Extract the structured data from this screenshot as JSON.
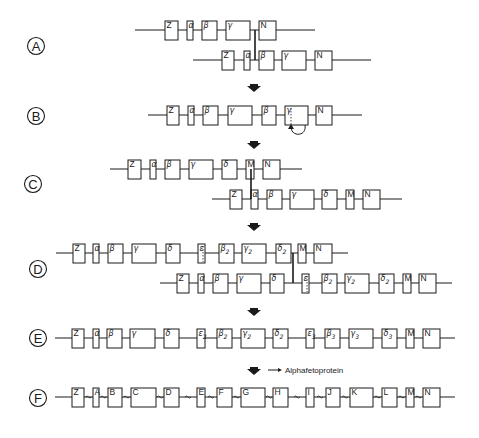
{
  "figure": {
    "note_label": "Alphafetoprotein",
    "colors": {
      "ink": "#1a1a1a",
      "background": "#ffffff"
    }
  },
  "steps": [
    {
      "id": "A",
      "label": "A",
      "strands": [
        {
          "y": 30,
          "x1": 135,
          "x2": 315,
          "exons": [
            {
              "label": "Z",
              "x": 165,
              "w": 13
            },
            {
              "label": "α",
              "x": 187,
              "w": 6
            },
            {
              "label": "β",
              "x": 202,
              "w": 15
            },
            {
              "label": "γ",
              "x": 226,
              "w": 24
            },
            {
              "label": "N",
              "x": 259,
              "w": 17
            }
          ]
        },
        {
          "y": 60,
          "x1": 193,
          "x2": 371,
          "exons": [
            {
              "label": "Z",
              "x": 222,
              "w": 12
            },
            {
              "label": "α",
              "x": 244,
              "w": 6
            },
            {
              "label": "β",
              "x": 259,
              "w": 15
            },
            {
              "label": "γ",
              "x": 282,
              "w": 24
            },
            {
              "label": "N",
              "x": 315,
              "w": 17
            }
          ]
        }
      ],
      "crossover": {
        "x": 255,
        "y1": 30,
        "y2": 60
      }
    },
    {
      "id": "B",
      "label": "B",
      "strands": [
        {
          "y": 115,
          "x1": 148,
          "x2": 362,
          "exons": [
            {
              "label": "Z",
              "x": 167,
              "w": 12
            },
            {
              "label": "α",
              "x": 188,
              "w": 6
            },
            {
              "label": "β",
              "x": 203,
              "w": 15
            },
            {
              "label": "γ",
              "x": 228,
              "w": 24
            },
            {
              "label": "β",
              "x": 262,
              "w": 14
            },
            {
              "label": "γ",
              "x": 285,
              "w": 23
            },
            {
              "label": "N",
              "x": 316,
              "w": 16
            }
          ]
        }
      ],
      "annotation": "curved arrow under second γ"
    },
    {
      "id": "C",
      "label": "C",
      "strands": [
        {
          "y": 169,
          "x1": 110,
          "x2": 302,
          "exons": [
            {
              "label": "Z",
              "x": 128,
              "w": 13
            },
            {
              "label": "α",
              "x": 150,
              "w": 6
            },
            {
              "label": "β",
              "x": 165,
              "w": 15
            },
            {
              "label": "γ",
              "x": 189,
              "w": 24
            },
            {
              "label": "δ",
              "x": 222,
              "w": 15
            },
            {
              "label": "M",
              "x": 246,
              "w": 8
            },
            {
              "label": "N",
              "x": 263,
              "w": 17
            }
          ]
        },
        {
          "y": 199,
          "x1": 212,
          "x2": 402,
          "exons": [
            {
              "label": "Z",
              "x": 230,
              "w": 12
            },
            {
              "label": "α",
              "x": 251,
              "w": 7
            },
            {
              "label": "β",
              "x": 267,
              "w": 15
            },
            {
              "label": "γ",
              "x": 290,
              "w": 24
            },
            {
              "label": "δ",
              "x": 322,
              "w": 15
            },
            {
              "label": "M",
              "x": 346,
              "w": 8
            },
            {
              "label": "N",
              "x": 363,
              "w": 17
            }
          ]
        }
      ],
      "crossover": {
        "x": 251,
        "y1": 169,
        "y2": 199
      }
    },
    {
      "id": "D",
      "label": "D",
      "strands": [
        {
          "y": 253,
          "x1": 56,
          "x2": 348,
          "exons": [
            {
              "label": "Z",
              "x": 73,
              "w": 12
            },
            {
              "label": "α",
              "x": 93,
              "w": 6
            },
            {
              "label": "β",
              "x": 108,
              "w": 15
            },
            {
              "label": "γ",
              "x": 132,
              "w": 24
            },
            {
              "label": "δ",
              "x": 166,
              "w": 14
            },
            {
              "label": "ε",
              "x": 198,
              "w": 7,
              "dotted": true
            },
            {
              "label": "β",
              "sub": "2",
              "x": 219,
              "w": 15
            },
            {
              "label": "γ",
              "sub": "2",
              "x": 242,
              "w": 24
            },
            {
              "label": "δ",
              "sub": "2",
              "x": 276,
              "w": 15
            },
            {
              "label": "M",
              "x": 298,
              "w": 8
            },
            {
              "label": "N",
              "x": 314,
              "w": 18
            }
          ]
        },
        {
          "y": 283,
          "x1": 160,
          "x2": 452,
          "exons": [
            {
              "label": "Z",
              "x": 177,
              "w": 12
            },
            {
              "label": "α",
              "x": 198,
              "w": 6
            },
            {
              "label": "β",
              "x": 213,
              "w": 15
            },
            {
              "label": "γ",
              "x": 237,
              "w": 24
            },
            {
              "label": "δ",
              "x": 270,
              "w": 14
            },
            {
              "label": "ε",
              "x": 302,
              "w": 7,
              "dotted": true
            },
            {
              "label": "β",
              "sub": "2",
              "x": 322,
              "w": 15
            },
            {
              "label": "γ",
              "sub": "2",
              "x": 345,
              "w": 24
            },
            {
              "label": "δ",
              "sub": "2",
              "x": 379,
              "w": 15
            },
            {
              "label": "M",
              "x": 403,
              "w": 8
            },
            {
              "label": "N",
              "x": 419,
              "w": 17
            }
          ]
        }
      ],
      "crossover": {
        "x": 293,
        "y1": 253,
        "y2": 283
      }
    },
    {
      "id": "E",
      "label": "E",
      "strands": [
        {
          "y": 338,
          "x1": 55,
          "x2": 455,
          "exons": [
            {
              "label": "Z",
              "x": 72,
              "w": 12
            },
            {
              "label": "α",
              "x": 93,
              "w": 6
            },
            {
              "label": "β",
              "x": 107,
              "w": 15
            },
            {
              "label": "γ",
              "x": 130,
              "w": 25
            },
            {
              "label": "δ",
              "x": 164,
              "w": 15
            },
            {
              "label": "ε",
              "sub": "2",
              "x": 197,
              "w": 8
            },
            {
              "label": "β",
              "sub": "2",
              "x": 217,
              "w": 15
            },
            {
              "label": "γ",
              "sub": "2",
              "x": 241,
              "w": 24
            },
            {
              "label": "δ",
              "sub": "2",
              "x": 273,
              "w": 15
            },
            {
              "label": "ε",
              "sub": "3",
              "x": 306,
              "w": 8
            },
            {
              "label": "β",
              "sub": "3",
              "x": 325,
              "w": 15
            },
            {
              "label": "γ",
              "sub": "3",
              "x": 349,
              "w": 24
            },
            {
              "label": "δ",
              "sub": "3",
              "x": 382,
              "w": 15
            },
            {
              "label": "M",
              "x": 406,
              "w": 8
            },
            {
              "label": "N",
              "x": 423,
              "w": 17
            }
          ]
        }
      ]
    },
    {
      "id": "F",
      "label": "F",
      "strands": [
        {
          "y": 397,
          "x1": 55,
          "x2": 455,
          "introns_wavy": true,
          "exons": [
            {
              "label": "Z",
              "x": 72,
              "w": 12
            },
            {
              "label": "A",
              "x": 93,
              "w": 6
            },
            {
              "label": "B",
              "x": 108,
              "w": 14
            },
            {
              "label": "C",
              "x": 131,
              "w": 25
            },
            {
              "label": "D",
              "x": 164,
              "w": 15
            },
            {
              "label": "E",
              "x": 197,
              "w": 8
            },
            {
              "label": "F",
              "x": 217,
              "w": 15
            },
            {
              "label": "G",
              "x": 241,
              "w": 24
            },
            {
              "label": "H",
              "x": 273,
              "w": 15
            },
            {
              "label": "I",
              "x": 306,
              "w": 8
            },
            {
              "label": "J",
              "x": 326,
              "w": 14
            },
            {
              "label": "K",
              "x": 350,
              "w": 23
            },
            {
              "label": "L",
              "x": 382,
              "w": 15
            },
            {
              "label": "M",
              "x": 406,
              "w": 8
            },
            {
              "label": "N",
              "x": 423,
              "w": 17
            }
          ]
        }
      ]
    }
  ],
  "step_markers": [
    {
      "label": "A",
      "cx": 36,
      "cy": 46
    },
    {
      "label": "B",
      "cx": 36,
      "cy": 116
    },
    {
      "label": "C",
      "cx": 33,
      "cy": 184
    },
    {
      "label": "D",
      "cx": 38,
      "cy": 269
    },
    {
      "label": "E",
      "cx": 38,
      "cy": 338
    },
    {
      "label": "F",
      "cx": 38,
      "cy": 398
    }
  ],
  "transition_arrows": [
    {
      "x": 254,
      "y": 88
    },
    {
      "x": 254,
      "y": 145
    },
    {
      "x": 254,
      "y": 227
    },
    {
      "x": 254,
      "y": 312
    },
    {
      "x": 254,
      "y": 371
    }
  ],
  "alphafetoprotein_pointer": {
    "x1": 268,
    "x2": 282,
    "y": 370,
    "text_x": 285,
    "text_y": 373
  }
}
